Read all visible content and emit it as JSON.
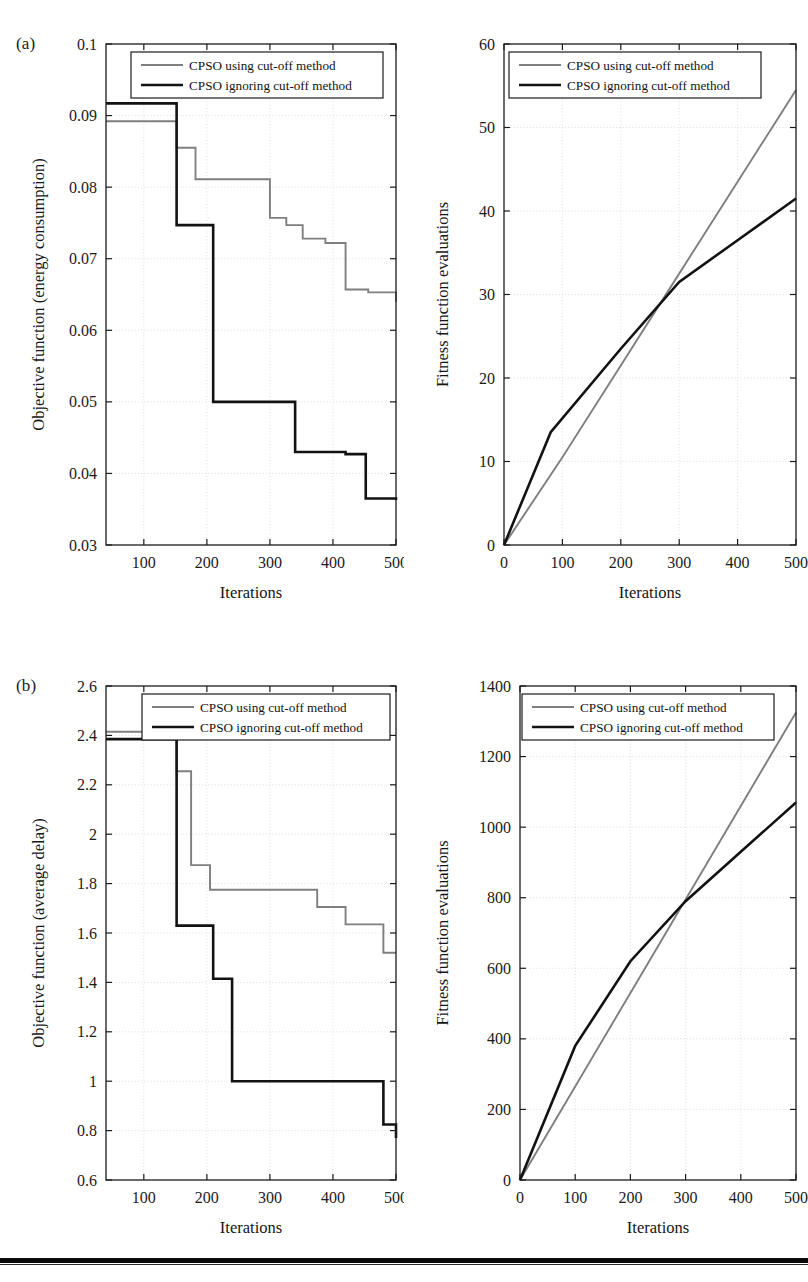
{
  "figure": {
    "panels": [
      {
        "tag": "(a)"
      },
      {
        "tag": "(b)"
      }
    ],
    "legend_series": [
      {
        "name": "CPSO using cut-off method",
        "color": "#7f7f7f"
      },
      {
        "name": "CPSO ignoring cut-off method",
        "color": "#121212"
      }
    ]
  },
  "chart_data": [
    {
      "id": "a-left",
      "type": "line",
      "title": "",
      "xlabel": "Iterations",
      "ylabel": "Objective function (energy consumption)",
      "xlim": [
        40,
        500
      ],
      "ylim": [
        0.03,
        0.1
      ],
      "xticks": [
        100,
        200,
        300,
        400,
        500
      ],
      "yticks": [
        0.03,
        0.04,
        0.05,
        0.06,
        0.07,
        0.08,
        0.09,
        0.1
      ],
      "ytick_labels": [
        "0.03",
        "0.04",
        "0.05",
        "0.06",
        "0.07",
        "0.08",
        "0.09",
        "0.1"
      ],
      "xtick_labels": [
        "100",
        "200",
        "300",
        "400",
        "500"
      ],
      "grid": true,
      "legend_position": "top-center",
      "step": "post",
      "series": [
        {
          "name": "CPSO using cut-off method",
          "color": "#7f7f7f",
          "x": [
            40,
            128,
            152,
            182,
            266,
            300,
            326,
            352,
            388,
            420,
            456,
            500
          ],
          "y": [
            0.0892,
            0.0892,
            0.0855,
            0.0811,
            0.0811,
            0.0757,
            0.0747,
            0.0728,
            0.0722,
            0.0657,
            0.0653,
            0.064
          ]
        },
        {
          "name": "CPSO ignoring cut-off method",
          "color": "#121212",
          "x": [
            40,
            128,
            152,
            210,
            340,
            420,
            452,
            500
          ],
          "y": [
            0.0917,
            0.0917,
            0.0747,
            0.05,
            0.043,
            0.0427,
            0.0365,
            0.0363
          ]
        }
      ]
    },
    {
      "id": "a-right",
      "type": "line",
      "title": "",
      "xlabel": "Iterations",
      "ylabel": "Fitness function evaluations",
      "xlim": [
        0,
        500
      ],
      "ylim": [
        0,
        60
      ],
      "xticks": [
        0,
        100,
        200,
        300,
        400,
        500
      ],
      "yticks": [
        0,
        10,
        20,
        30,
        40,
        50,
        60
      ],
      "ytick_labels": [
        "0",
        "10",
        "20",
        "30",
        "40",
        "50",
        "60"
      ],
      "xtick_labels": [
        "0",
        "100",
        "200",
        "300",
        "400",
        "500"
      ],
      "grid": true,
      "legend_position": "top-center",
      "series": [
        {
          "name": "CPSO using cut-off method",
          "color": "#7f7f7f",
          "x": [
            0,
            100,
            200,
            300,
            400,
            500
          ],
          "y": [
            0,
            10.5,
            21.5,
            32.5,
            43.5,
            54.5
          ]
        },
        {
          "name": "CPSO ignoring cut-off method",
          "color": "#121212",
          "x": [
            0,
            80,
            200,
            300,
            400,
            500
          ],
          "y": [
            0,
            13.5,
            23.5,
            31.5,
            36.5,
            41.5
          ]
        }
      ]
    },
    {
      "id": "b-left",
      "type": "line",
      "title": "",
      "xlabel": "Iterations",
      "ylabel": "Objective function (average delay)",
      "xlim": [
        40,
        500
      ],
      "ylim": [
        0.6,
        2.6
      ],
      "xticks": [
        100,
        200,
        300,
        400,
        500
      ],
      "yticks": [
        0.6,
        0.8,
        1.0,
        1.2,
        1.4,
        1.6,
        1.8,
        2.0,
        2.2,
        2.4,
        2.6
      ],
      "ytick_labels": [
        "0.6",
        "0.8",
        "1",
        "1.2",
        "1.4",
        "1.6",
        "1.8",
        "2",
        "2.2",
        "2.4",
        "2.6"
      ],
      "xtick_labels": [
        "100",
        "200",
        "300",
        "400",
        "500"
      ],
      "grid": true,
      "legend_position": "top-center",
      "step": "post",
      "series": [
        {
          "name": "CPSO using cut-off method",
          "color": "#7f7f7f",
          "x": [
            40,
            133,
            152,
            175,
            205,
            330,
            375,
            420,
            480,
            500
          ],
          "y": [
            2.415,
            2.415,
            2.255,
            1.875,
            1.775,
            1.775,
            1.705,
            1.635,
            1.52,
            1.52
          ]
        },
        {
          "name": "CPSO ignoring cut-off method",
          "color": "#121212",
          "x": [
            40,
            133,
            152,
            210,
            240,
            480,
            500
          ],
          "y": [
            2.385,
            2.385,
            1.63,
            1.415,
            1.0,
            0.825,
            0.77
          ]
        }
      ]
    },
    {
      "id": "b-right",
      "type": "line",
      "title": "",
      "xlabel": "Iterations",
      "ylabel": "Fitness function evaluations",
      "xlim": [
        0,
        500
      ],
      "ylim": [
        0,
        1400
      ],
      "xticks": [
        0,
        100,
        200,
        300,
        400,
        500
      ],
      "yticks": [
        0,
        200,
        400,
        600,
        800,
        1000,
        1200,
        1400
      ],
      "ytick_labels": [
        "0",
        "200",
        "400",
        "600",
        "800",
        "1000",
        "1200",
        "1400"
      ],
      "xtick_labels": [
        "0",
        "100",
        "200",
        "300",
        "400",
        "500"
      ],
      "grid": true,
      "legend_position": "top-center",
      "series": [
        {
          "name": "CPSO using cut-off method",
          "color": "#7f7f7f",
          "x": [
            0,
            100,
            200,
            300,
            400,
            500
          ],
          "y": [
            0,
            265,
            530,
            795,
            1060,
            1325
          ]
        },
        {
          "name": "CPSO ignoring cut-off method",
          "color": "#121212",
          "x": [
            0,
            100,
            200,
            300,
            400,
            500
          ],
          "y": [
            0,
            380,
            620,
            790,
            930,
            1070
          ]
        }
      ]
    }
  ]
}
